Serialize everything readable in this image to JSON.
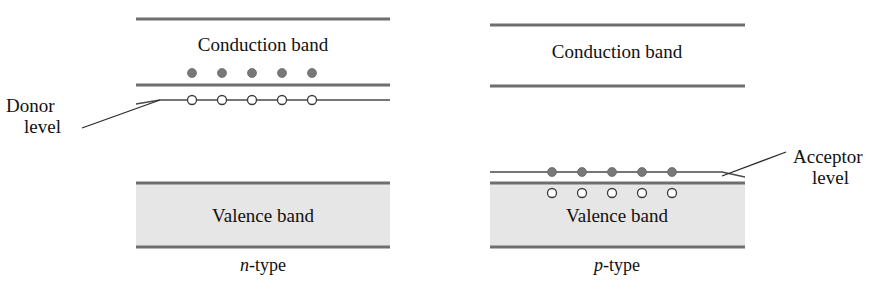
{
  "figure": {
    "width": 875,
    "height": 301,
    "background_color": "#ffffff"
  },
  "colors": {
    "band_edge": "#6e6e6e",
    "valence_fill": "#e6e6e6",
    "electron_fill": "#787878",
    "hole_fill": "#ffffff",
    "hole_stroke": "#3c3c3c",
    "text": "#111111",
    "leader": "#2b2b2b"
  },
  "panels": [
    {
      "id": "n-type",
      "type_label_prefix": "n",
      "type_label_suffix": "-type",
      "type_label_full": "n-type",
      "conduction_band_label": "Conduction band",
      "valence_band_label": "Valence band",
      "impurity_label_line1": "Donor",
      "impurity_label_line2": "level",
      "impurity_label_full": "Donor level",
      "geometry": {
        "band_left": 136,
        "band_right": 390,
        "conduction_top_y": 19,
        "conduction_bottom_y": 85,
        "valence_top_y": 182,
        "valence_bottom_y": 248,
        "impurity_level_y": 100,
        "impurity_kink_x": 160,
        "impurity_left_x": 136,
        "conduction_label_x": 263,
        "conduction_label_y": 51,
        "valence_label_x": 263,
        "valence_label_y": 222,
        "type_label_x": 263,
        "type_label_y": 271
      },
      "electrons": {
        "count": 5,
        "y": 73,
        "x_positions": [
          192,
          222,
          252,
          282,
          312
        ],
        "radius": 4.5,
        "role": "conduction-band electrons"
      },
      "holes": {
        "count": 5,
        "y": 100,
        "x_positions": [
          192,
          222,
          252,
          282,
          312
        ],
        "radius": 4.5,
        "role": "ionized donor sites on donor level"
      },
      "callout": {
        "label_x": 6,
        "label_line1_y": 112,
        "label_line2_y": 133,
        "leader_from_x": 82,
        "leader_from_y": 128,
        "leader_to_x": 160,
        "leader_to_y": 100
      }
    },
    {
      "id": "p-type",
      "type_label_prefix": "p",
      "type_label_suffix": "-type",
      "type_label_full": "p-type",
      "conduction_band_label": "Conduction band",
      "valence_band_label": "Valence band",
      "impurity_label_line1": "Acceptor",
      "impurity_label_line2": "level",
      "impurity_label_full": "Acceptor level",
      "geometry": {
        "band_left": 490,
        "band_right": 745,
        "conduction_top_y": 25,
        "conduction_bottom_y": 86,
        "valence_top_y": 182,
        "valence_bottom_y": 248,
        "impurity_level_y": 173,
        "impurity_kink_x": 722,
        "impurity_right_x": 745,
        "conduction_label_x": 617,
        "conduction_label_y": 58,
        "valence_label_x": 617,
        "valence_label_y": 222,
        "type_label_x": 617,
        "type_label_y": 271
      },
      "electrons": {
        "count": 5,
        "y": 173,
        "x_positions": [
          552,
          582,
          612,
          642,
          672
        ],
        "radius": 4.5,
        "role": "electrons captured on acceptor level"
      },
      "holes": {
        "count": 5,
        "y": 193,
        "x_positions": [
          552,
          582,
          612,
          642,
          672
        ],
        "radius": 4.5,
        "role": "valence band holes"
      },
      "callout": {
        "label_x": 793,
        "label_line1_y": 163,
        "label_line2_y": 184,
        "leader_from_x": 786,
        "leader_from_y": 152,
        "leader_to_x": 722,
        "leader_to_y": 176
      }
    }
  ]
}
